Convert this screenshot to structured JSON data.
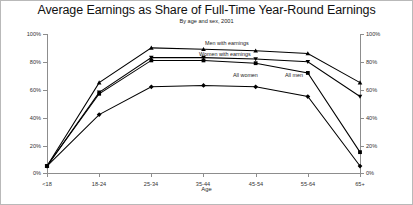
{
  "chart_data": {
    "type": "line",
    "title": "Average Earnings as Share of Full-Time Year-Round Earnings",
    "subtitle": "By age and sex, 2001",
    "xlabel": "Age",
    "ylabel": "",
    "ylim": [
      0,
      100
    ],
    "yticks": [
      "0%",
      "20%",
      "40%",
      "60%",
      "80%",
      "100%"
    ],
    "ytick_values": [
      0,
      20,
      40,
      60,
      80,
      100
    ],
    "dual_y_axis": true,
    "grid": false,
    "legend_position": "inline-labels",
    "categories": [
      "<18",
      "18-24",
      "25-34",
      "35-44",
      "45-54",
      "55-64",
      "65+"
    ],
    "series": [
      {
        "name": "Men with earnings",
        "values": [
          5,
          65,
          90,
          89,
          88,
          86,
          65
        ]
      },
      {
        "name": "Women with earnings",
        "values": [
          5,
          58,
          83,
          83,
          82,
          80,
          55
        ]
      },
      {
        "name": "All men",
        "values": [
          5,
          57,
          81,
          81,
          79,
          72,
          15
        ]
      },
      {
        "name": "All women",
        "values": [
          5,
          42,
          62,
          63,
          62,
          55,
          5
        ]
      }
    ],
    "annotations": [
      {
        "text": "Men with earnings",
        "category": "45-54"
      },
      {
        "text": "Women with earnings",
        "category": "45-54"
      },
      {
        "text": "All women",
        "category": "45-54"
      },
      {
        "text": "All men",
        "category": "55-64"
      }
    ],
    "colors": {
      "line": "#000000",
      "axis": "#8d8d8d",
      "background": "#ffffff",
      "border": "#b9b9b9"
    }
  }
}
